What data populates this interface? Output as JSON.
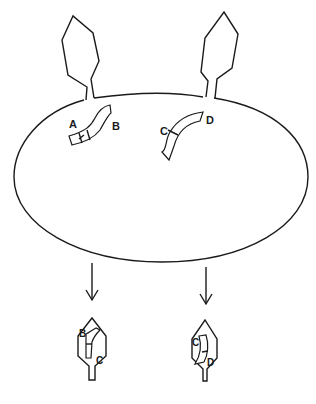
{
  "diagram": {
    "colors": {
      "stroke": "#1a1a1a",
      "background": "#ffffff"
    },
    "cell": {
      "shape": "ellipse"
    },
    "infecting_phages": [
      {
        "name": "left-phage"
      },
      {
        "name": "right-phage"
      }
    ],
    "cell_fragments": [
      {
        "name": "fragment-ab",
        "labels": {
          "left": "A",
          "right": "B"
        }
      },
      {
        "name": "fragment-cd",
        "labels": {
          "left": "C",
          "right": "D"
        }
      }
    ],
    "progeny_phages": [
      {
        "name": "progeny-left",
        "labels": {
          "top": "B",
          "bottom": "C"
        }
      },
      {
        "name": "progeny-right",
        "labels": {
          "top": "C",
          "bottom": "D"
        }
      }
    ]
  }
}
